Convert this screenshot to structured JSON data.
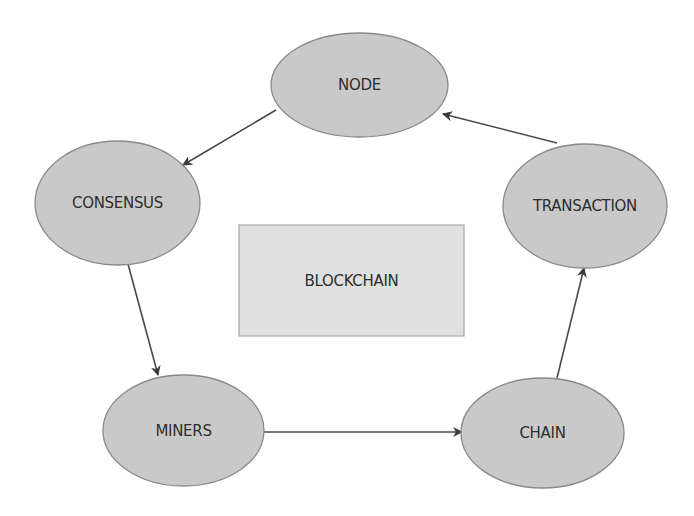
{
  "diagram": {
    "center": {
      "label": "BLOCKCHAIN",
      "shape": "rectangle",
      "x": 239,
      "y": 225,
      "width": 225,
      "height": 111,
      "fill": "#e0e0e0",
      "stroke": "#a8a8a8"
    },
    "nodes": [
      {
        "id": "node",
        "label": "NODE",
        "cx": 359.5,
        "cy": 85,
        "rx": 88.5,
        "ry": 52
      },
      {
        "id": "consensus",
        "label": "CONSENSUS",
        "cx": 117.5,
        "cy": 203,
        "rx": 82.5,
        "ry": 62
      },
      {
        "id": "transaction",
        "label": "TRANSACTION",
        "cx": 585,
        "cy": 206,
        "rx": 82,
        "ry": 62
      },
      {
        "id": "miners",
        "label": "MINERS",
        "cx": 183.5,
        "cy": 430.5,
        "rx": 80.5,
        "ry": 55.5
      },
      {
        "id": "chain",
        "label": "CHAIN",
        "cx": 542.5,
        "cy": 433,
        "rx": 81.5,
        "ry": 55
      }
    ],
    "edges": [
      {
        "from": "node",
        "to": "consensus",
        "x1": 276,
        "y1": 110,
        "x2": 183,
        "y2": 165
      },
      {
        "from": "consensus",
        "to": "miners",
        "x1": 128,
        "y1": 264,
        "x2": 158,
        "y2": 375
      },
      {
        "from": "miners",
        "to": "chain",
        "x1": 264,
        "y1": 432,
        "x2": 462,
        "y2": 432
      },
      {
        "from": "chain",
        "to": "transaction",
        "x1": 557,
        "y1": 378,
        "x2": 584,
        "y2": 268
      },
      {
        "from": "transaction",
        "to": "node",
        "x1": 557,
        "y1": 143,
        "x2": 443,
        "y2": 114
      }
    ],
    "style": {
      "ellipse_fill": "#c9c9c9",
      "ellipse_stroke": "#8a8a8a",
      "edge_color": "#4a4a4a",
      "text_color": "#2e2e2e"
    }
  }
}
